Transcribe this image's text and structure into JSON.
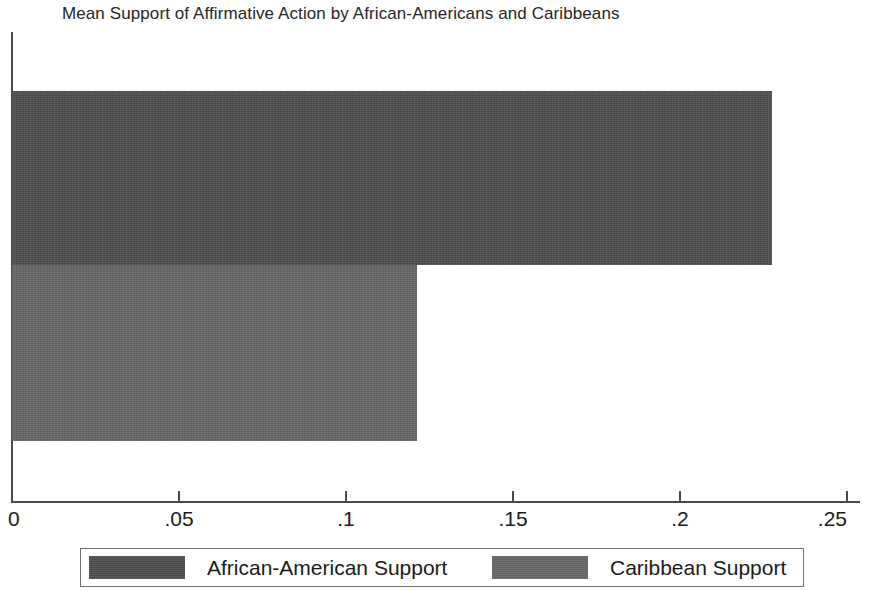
{
  "chart_data": {
    "type": "bar",
    "orientation": "horizontal",
    "title": "Mean Support of Affirmative Action by African-Americans and Caribbeans",
    "xlabel": "",
    "ylabel": "",
    "xlim": [
      0,
      0.25
    ],
    "grid": false,
    "legend_position": "bottom",
    "categories": [
      "African-American Support",
      "Caribbean Support"
    ],
    "values": [
      0.2275,
      0.1213
    ],
    "series": [
      {
        "name": "African-American Support",
        "value": 0.2275,
        "color": "#505050"
      },
      {
        "name": "Caribbean Support",
        "value": 0.1213,
        "color": "#686868"
      }
    ],
    "xticks": [
      {
        "value": 0,
        "label": "0"
      },
      {
        "value": 0.05,
        "label": ".05"
      },
      {
        "value": 0.1,
        "label": ".1"
      },
      {
        "value": 0.15,
        "label": ".15"
      },
      {
        "value": 0.2,
        "label": ".2"
      },
      {
        "value": 0.25,
        "label": ".25"
      }
    ],
    "yticks": [],
    "axis_color": "#4a4a4a"
  },
  "legend": {
    "entries": [
      {
        "label": "African-American Support",
        "color": "#505050"
      },
      {
        "label": "Caribbean Support",
        "color": "#686868"
      }
    ]
  }
}
